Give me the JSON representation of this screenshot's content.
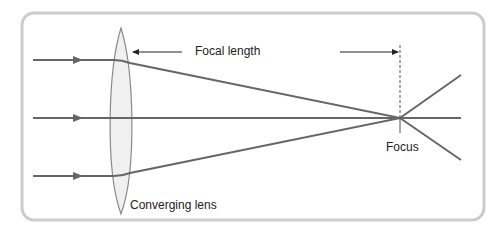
{
  "labels": {
    "focal_length": "Focal length",
    "focus": "Focus",
    "lens": "Converging lens"
  },
  "colors": {
    "frame": "#cccccc",
    "ray": "#666666",
    "lens_fill": "#f0f0f0",
    "lens_stroke": "#8a8a8a",
    "text": "#222222"
  },
  "rays": [
    {
      "name": "top-ray",
      "y": 60
    },
    {
      "name": "axis-ray",
      "y": 118
    },
    {
      "name": "bottom-ray",
      "y": 176
    }
  ],
  "focus_point": {
    "x": 400,
    "y": 118
  }
}
